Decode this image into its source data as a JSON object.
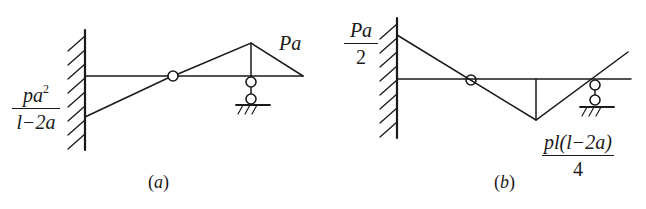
{
  "figure": {
    "panels": [
      {
        "id": "a",
        "caption_letter": "a",
        "caption_open": "(",
        "caption_close": ")",
        "support_left": "fixed-wall",
        "support_right": "roller",
        "hinge": true,
        "labels": {
          "right_peak": "Pa",
          "left_fraction": {
            "numerator": "pa",
            "numerator_exp": "2",
            "denominator": "l−2a"
          }
        }
      },
      {
        "id": "b",
        "caption_letter": "b",
        "caption_open": "(",
        "caption_close": ")",
        "support_left": "fixed-wall",
        "support_right": "roller",
        "hinge": true,
        "labels": {
          "left_fraction": {
            "numerator": "Pa",
            "denominator": "2"
          },
          "bottom_fraction": {
            "numerator": "pl(l−2a)",
            "denominator": "4"
          }
        }
      }
    ],
    "colors": {
      "line": "#1a1a1a",
      "background": "#ffffff"
    }
  }
}
